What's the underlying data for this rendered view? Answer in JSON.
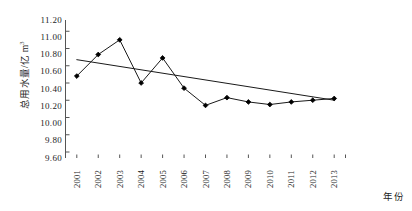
{
  "chart_data": {
    "type": "line",
    "title": "",
    "subtitle": "",
    "xlabel": "年份",
    "ylabel": "总用水量/亿 m",
    "ylabel_superscript": "3",
    "categories": [
      "2001",
      "2002",
      "2003",
      "2004",
      "2005",
      "2006",
      "2007",
      "2008",
      "2009",
      "2010",
      "2011",
      "2012",
      "2013"
    ],
    "ylim": [
      9.6,
      11.2
    ],
    "ytick_labels": [
      "11.20",
      "11.00",
      "10.80",
      "10.60",
      "10.40",
      "10.20",
      "10.00",
      "9.80",
      "9.60"
    ],
    "ytick_values": [
      11.2,
      11.0,
      10.8,
      10.6,
      10.4,
      10.2,
      10.0,
      9.8,
      9.6
    ],
    "grid": false,
    "legend": "none",
    "series": [
      {
        "name": "总用水量",
        "type": "line",
        "marker": "filled-diamond",
        "values": [
          10.55,
          10.8,
          10.97,
          10.47,
          10.76,
          10.41,
          10.21,
          10.3,
          10.25,
          10.22,
          10.25,
          10.27,
          10.29
        ]
      },
      {
        "name": "线性趋势线",
        "type": "trendline",
        "marker": "none",
        "values": [
          10.74,
          10.7,
          10.66,
          10.62,
          10.58,
          10.54,
          10.5,
          10.46,
          10.42,
          10.38,
          10.34,
          10.3,
          10.27
        ]
      }
    ],
    "colors": {
      "line": "#1a1a1a",
      "marker": "#000000",
      "trendline": "#1a1a1a",
      "axis": "#555555",
      "text": "#1d1d1d",
      "background": "#ffffff"
    }
  }
}
